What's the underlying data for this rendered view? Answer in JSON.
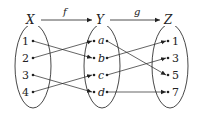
{
  "diagram": {
    "sets": {
      "X": {
        "label": "X",
        "elements": [
          "1",
          "2",
          "3",
          "4"
        ]
      },
      "Y": {
        "label": "Y",
        "elements": [
          "a",
          "b",
          "c",
          "d"
        ]
      },
      "Z": {
        "label": "Z",
        "elements": [
          "1",
          "3",
          "5",
          "7"
        ]
      }
    },
    "functions": {
      "f": {
        "label": "f",
        "from": "X",
        "to": "Y",
        "mapping": [
          [
            "1",
            "b"
          ],
          [
            "2",
            "a"
          ],
          [
            "3",
            "d"
          ],
          [
            "4",
            "c"
          ]
        ]
      },
      "g": {
        "label": "g",
        "from": "Y",
        "to": "Z",
        "mapping": [
          [
            "a",
            "5"
          ],
          [
            "b",
            "1"
          ],
          [
            "c",
            "3"
          ],
          [
            "d",
            "7"
          ]
        ]
      }
    }
  }
}
